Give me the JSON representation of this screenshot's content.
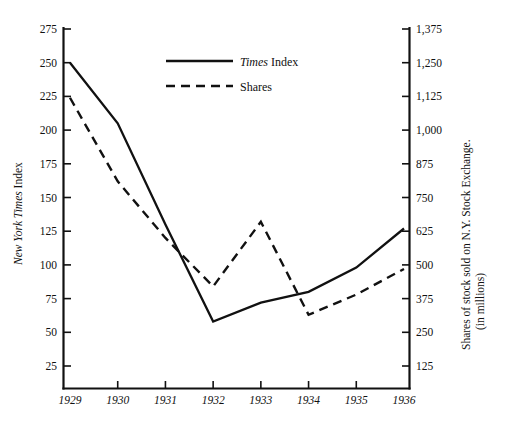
{
  "chart_data": {
    "type": "line",
    "title": "",
    "subtitle": "",
    "xlabel": "",
    "categories": [
      "1929",
      "1930",
      "1931",
      "1932",
      "1933",
      "1934",
      "1935",
      "1936"
    ],
    "x": [
      1929,
      1930,
      1931,
      1932,
      1933,
      1934,
      1935,
      1936
    ],
    "grid": false,
    "legend_position": "top-center",
    "axes": {
      "left": {
        "label_plain": "New York Times Index",
        "label_italic_part": "New York Times",
        "label_roman_part": "Index",
        "ticks": [
          25,
          50,
          75,
          100,
          125,
          150,
          175,
          200,
          225,
          250,
          275
        ],
        "tick_labels": [
          "25",
          "50",
          "75",
          "100",
          "125",
          "150",
          "175",
          "200",
          "225",
          "250",
          "275"
        ],
        "ylim": [
          0,
          275
        ],
        "step": 25
      },
      "right": {
        "label_line1": "Shares of stock sold on N.Y. Stock Exchange.",
        "label_line2": "(in millions)",
        "ticks": [
          125,
          250,
          375,
          500,
          625,
          750,
          875,
          1000,
          1125,
          1250,
          1375
        ],
        "tick_labels": [
          "125",
          "250",
          "375",
          "500",
          "625",
          "750",
          "875",
          "1,000",
          "1,125",
          "1,250",
          "1,375"
        ],
        "ylim": [
          0,
          1375
        ],
        "step": 125
      }
    },
    "series": [
      {
        "name": "Times Index",
        "name_italic_part": "Times",
        "name_roman_part": "Index",
        "style": "solid",
        "axis": "left",
        "color": "#111111",
        "values": [
          250,
          205,
          130,
          58,
          72,
          80,
          98,
          127
        ]
      },
      {
        "name": "Shares",
        "style": "dashed",
        "axis": "right",
        "color": "#111111",
        "values": [
          1120,
          810,
          600,
          420,
          660,
          315,
          390,
          485
        ]
      }
    ]
  },
  "legend": {
    "items": [
      {
        "label_italic": "Times",
        "label_rest": " Index",
        "style": "solid"
      },
      {
        "label_italic": "",
        "label_rest": "Shares",
        "style": "dashed"
      }
    ]
  }
}
